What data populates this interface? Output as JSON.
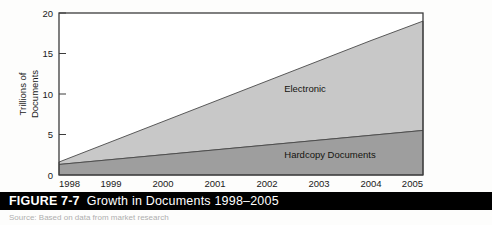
{
  "caption": {
    "figure_number": "FIGURE 7-7",
    "title": "Growth in Documents 1998–2005"
  },
  "source_note": "Source: Based on data from market research",
  "chart_data": {
    "type": "area",
    "stacked": true,
    "title": "Growth in Documents 1998–2005",
    "xlabel": "",
    "ylabel": "Trillions of Documents",
    "categories": [
      "1998",
      "1999",
      "2000",
      "2001",
      "2002",
      "2003",
      "2004",
      "2005"
    ],
    "x_tick_labels": [
      "1998",
      "1999",
      "2000",
      "2001",
      "2002",
      "2003",
      "2004",
      "2005"
    ],
    "y_tick_labels": [
      "0",
      "5",
      "10",
      "15",
      "20"
    ],
    "y_ticks": [
      0,
      5,
      10,
      15,
      20
    ],
    "ylim": [
      0,
      20
    ],
    "grid": false,
    "legend_position": "inline-labels",
    "series": [
      {
        "name": "Hardcopy Documents",
        "values": [
          1.3,
          1.9,
          2.5,
          3.1,
          3.7,
          4.3,
          4.9,
          5.5
        ],
        "color": "#9e9e9e",
        "label_text": "Hardcopy Documents"
      },
      {
        "name": "Electronic",
        "values": [
          0.3,
          2.9,
          5.4,
          8.0,
          10.5,
          13.1,
          15.6,
          13.5
        ],
        "cumulative_top": [
          1.6,
          4.1,
          6.6,
          9.1,
          11.6,
          14.1,
          16.6,
          19.0
        ],
        "color": "#c8c8c8",
        "label_text": "Electronic"
      }
    ],
    "annotations": [
      {
        "text": "Electronic",
        "series": "Electronic"
      },
      {
        "text": "Hardcopy Documents",
        "series": "Hardcopy Documents"
      }
    ]
  }
}
